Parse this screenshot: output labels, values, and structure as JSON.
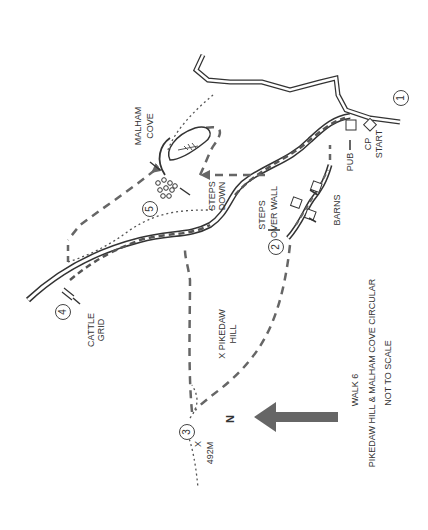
{
  "map": {
    "title": "WALK 6",
    "subtitle": "PIKEDAW HILL & MALHAM COVE CIRCULAR",
    "scale_note": "NOT TO SCALE",
    "north_label": "N",
    "colors": {
      "road": "#333333",
      "route": "#666666",
      "footpath": "#555555",
      "arrow": "#666666"
    },
    "waypoints": [
      {
        "n": "1",
        "label": "CP START"
      },
      {
        "n": "2",
        "label": "STEPS OVER WALL"
      },
      {
        "n": "3",
        "label": "492M"
      },
      {
        "n": "4",
        "label": "CATTLE GRID"
      },
      {
        "n": "5",
        "label": "STEPS DOWN"
      }
    ],
    "labels": {
      "malham_cove_1": "MALHAM",
      "malham_cove_2": "COVE",
      "steps_down_1": "STEPS",
      "steps_down_2": "DOWN",
      "steps_over_1": "STEPS",
      "steps_over_2": "OVER WALL",
      "pub": "PUB",
      "cp": "CP",
      "start": "START",
      "barns": "BARNS",
      "cattle_1": "CATTLE",
      "cattle_2": "GRID",
      "pikedaw_1": "X PIKEDAW",
      "pikedaw_2": "HILL",
      "summit_x": "X",
      "summit_h": "492M"
    }
  }
}
